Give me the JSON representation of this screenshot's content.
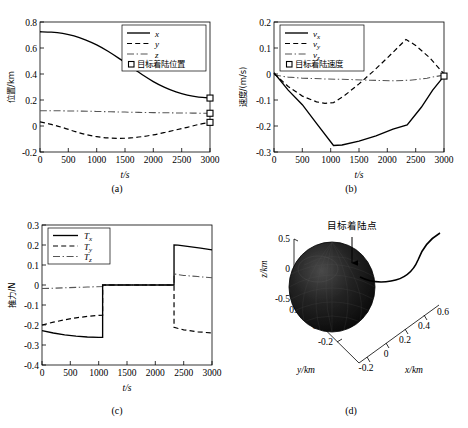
{
  "figure": {
    "panels": [
      "a",
      "b",
      "c",
      "d"
    ],
    "captions": {
      "a": "(a)",
      "b": "(b)",
      "c": "(c)",
      "d": "(d)"
    }
  },
  "chart_data": [
    {
      "panel": "a",
      "type": "line",
      "title": "",
      "xlabel": "t/s",
      "ylabel": "位置/km",
      "xlim": [
        0,
        3000
      ],
      "ylim": [
        -0.2,
        0.8
      ],
      "xticks": [
        0,
        500,
        1000,
        1500,
        2000,
        2500,
        3000
      ],
      "xticklabels": [
        "0",
        "500",
        "1000",
        "1500",
        "2000",
        "2500",
        "3000"
      ],
      "yticks": [
        -0.2,
        0,
        0.2,
        0.4,
        0.6,
        0.8
      ],
      "yticklabels": [
        "-0.2",
        "0",
        "0.2",
        "0.4",
        "0.6",
        "0.8"
      ],
      "grid": false,
      "legend_position": "upper right",
      "legend": [
        "x",
        "y",
        "z",
        "目标着陆位置"
      ],
      "series": [
        {
          "name": "x",
          "style": "solid",
          "x": [
            0,
            200,
            400,
            600,
            800,
            1000,
            1200,
            1400,
            1600,
            1800,
            2000,
            2200,
            2400,
            2600,
            2800,
            3000
          ],
          "values": [
            0.725,
            0.722,
            0.712,
            0.693,
            0.663,
            0.624,
            0.575,
            0.518,
            0.456,
            0.396,
            0.342,
            0.297,
            0.262,
            0.237,
            0.222,
            0.215
          ]
        },
        {
          "name": "y",
          "style": "dashed",
          "x": [
            0,
            200,
            400,
            600,
            800,
            1000,
            1200,
            1400,
            1600,
            1800,
            2000,
            2200,
            2400,
            2600,
            2800,
            3000
          ],
          "values": [
            0.032,
            0.012,
            -0.012,
            -0.04,
            -0.065,
            -0.082,
            -0.092,
            -0.095,
            -0.092,
            -0.082,
            -0.068,
            -0.05,
            -0.03,
            -0.01,
            0.012,
            0.028
          ]
        },
        {
          "name": "z",
          "style": "dashdot",
          "x": [
            0,
            500,
            1000,
            1500,
            2000,
            2500,
            3000
          ],
          "values": [
            0.118,
            0.116,
            0.112,
            0.107,
            0.103,
            0.1,
            0.098
          ]
        }
      ],
      "markers": [
        {
          "name": "目标着陆位置",
          "x": 3000,
          "y": 0.215
        },
        {
          "name": "目标着陆位置",
          "x": 3000,
          "y": 0.098
        },
        {
          "name": "目标着陆位置",
          "x": 3000,
          "y": 0.028
        }
      ]
    },
    {
      "panel": "b",
      "type": "line",
      "title": "",
      "xlabel": "t/s",
      "ylabel": "速度/(m/s)",
      "xlim": [
        0,
        3000
      ],
      "ylim": [
        -0.3,
        0.2
      ],
      "xticks": [
        0,
        500,
        1000,
        1500,
        2000,
        2500,
        3000
      ],
      "xticklabels": [
        "0",
        "500",
        "1000",
        "1500",
        "2000",
        "2500",
        "3000"
      ],
      "yticks": [
        -0.3,
        -0.2,
        -0.1,
        0,
        0.1,
        0.2
      ],
      "yticklabels": [
        "-0.3",
        "-0.2",
        "-0.1",
        "0",
        "0.1",
        "0.2"
      ],
      "grid": false,
      "legend_position": "upper left",
      "legend": [
        "v_x",
        "v_y",
        "v_z",
        "目标着陆速度"
      ],
      "series": [
        {
          "name": "v_x",
          "style": "solid",
          "x": [
            0,
            250,
            500,
            750,
            1050,
            1200,
            1500,
            1800,
            2100,
            2350,
            2600,
            2800,
            3000
          ],
          "values": [
            0.005,
            -0.062,
            -0.118,
            -0.19,
            -0.275,
            -0.273,
            -0.258,
            -0.238,
            -0.212,
            -0.196,
            -0.128,
            -0.062,
            -0.008
          ]
        },
        {
          "name": "v_y",
          "style": "dashed",
          "x": [
            0,
            250,
            500,
            750,
            900,
            1050,
            1250,
            1500,
            1750,
            2000,
            2200,
            2330,
            2500,
            2750,
            3000
          ],
          "values": [
            0.002,
            -0.048,
            -0.085,
            -0.107,
            -0.113,
            -0.11,
            -0.082,
            -0.038,
            0.01,
            0.062,
            0.105,
            0.133,
            0.11,
            0.062,
            0.0
          ]
        },
        {
          "name": "v_z",
          "style": "dashdot",
          "x": [
            0,
            250,
            500,
            900,
            1300,
            1700,
            2100,
            2400,
            2700,
            3000
          ],
          "values": [
            -0.004,
            -0.012,
            -0.016,
            -0.019,
            -0.021,
            -0.024,
            -0.026,
            -0.024,
            -0.016,
            -0.004
          ]
        }
      ],
      "markers": [
        {
          "name": "目标着陆速度",
          "x": 3000,
          "y": -0.008
        }
      ]
    },
    {
      "panel": "c",
      "type": "line",
      "title": "",
      "xlabel": "t/s",
      "ylabel": "推力/N",
      "xlim": [
        0,
        3000
      ],
      "ylim": [
        -0.4,
        0.3
      ],
      "xticks": [
        0,
        500,
        1000,
        1500,
        2000,
        2500,
        3000
      ],
      "xticklabels": [
        "0",
        "500",
        "1000",
        "1500",
        "2000",
        "2500",
        "3000"
      ],
      "yticks": [
        -0.4,
        -0.3,
        -0.2,
        -0.1,
        0,
        0.1,
        0.2,
        0.3
      ],
      "yticklabels": [
        "-0.4",
        "-0.3",
        "-0.2",
        "-0.1",
        "0",
        "0.1",
        "0.2",
        "0.3"
      ],
      "grid": false,
      "legend_position": "upper left",
      "legend": [
        "T_x",
        "T_y",
        "T_z"
      ],
      "switch_times": [
        1070,
        2330
      ],
      "series": [
        {
          "name": "T_x",
          "style": "solid",
          "x": [
            0,
            200,
            400,
            600,
            800,
            1000,
            1070,
            1070,
            2330,
            2330,
            2400,
            2600,
            2800,
            3000
          ],
          "values": [
            -0.228,
            -0.24,
            -0.249,
            -0.256,
            -0.26,
            -0.262,
            -0.262,
            0.0,
            0.0,
            0.2,
            0.199,
            0.192,
            0.184,
            0.176
          ]
        },
        {
          "name": "T_y",
          "style": "dashed",
          "x": [
            0,
            200,
            400,
            600,
            800,
            1000,
            1070,
            1070,
            2330,
            2330,
            2500,
            2750,
            3000
          ],
          "values": [
            -0.2,
            -0.186,
            -0.174,
            -0.164,
            -0.157,
            -0.152,
            -0.151,
            0.0,
            0.0,
            -0.212,
            -0.224,
            -0.234,
            -0.24
          ]
        },
        {
          "name": "T_z",
          "style": "dashdot",
          "x": [
            0,
            400,
            800,
            1070,
            1070,
            2330,
            2330,
            2500,
            2750,
            3000
          ],
          "values": [
            -0.018,
            -0.014,
            -0.01,
            -0.008,
            0.0,
            0.0,
            0.055,
            0.048,
            0.042,
            0.036
          ]
        }
      ]
    },
    {
      "panel": "d",
      "type": "scatter",
      "title": "",
      "projection": "3d",
      "xlabel": "x/km",
      "ylabel": "y/km",
      "zlabel": "z/km",
      "xticklabels": [
        "-0.2",
        "0",
        "0.2",
        "0.4",
        "0.6"
      ],
      "yticklabels": [
        "-0.2",
        "0",
        "0.2"
      ],
      "zticklabels": [
        "-0.5",
        "0",
        "0.5"
      ],
      "annotation": "目标着陆点",
      "body": "asteroid",
      "trajectory": "descent-path"
    }
  ]
}
